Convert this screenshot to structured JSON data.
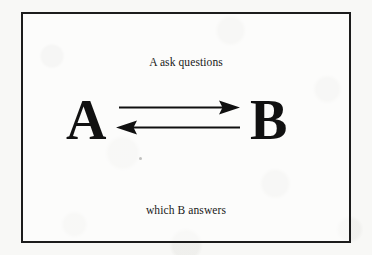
{
  "diagram": {
    "title_top": "A ask questions",
    "title_bottom": "which B answers",
    "nodes": [
      {
        "id": "a",
        "label": "A"
      },
      {
        "id": "b",
        "label": "B"
      }
    ],
    "edges": [
      {
        "id": "a-to-b",
        "from": "A",
        "to": "B",
        "direction": "right",
        "meaning": "A ask questions"
      },
      {
        "id": "b-to-a",
        "from": "B",
        "to": "A",
        "direction": "left",
        "meaning": "which B answers"
      }
    ],
    "frame": {
      "shape": "rectangle",
      "stroke_color": "#1c1c1c"
    },
    "colors": {
      "ink": "#111111",
      "paper": "#f8f8f6",
      "frame_stroke": "#1c1c1c"
    }
  }
}
